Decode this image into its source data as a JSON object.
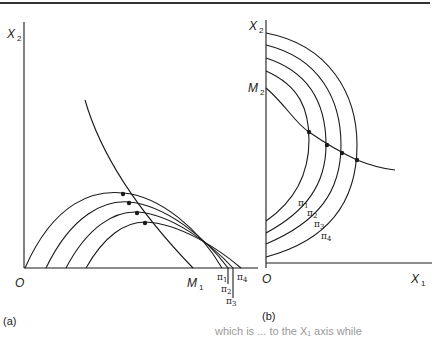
{
  "figure": {
    "panel_a": {
      "tag": "(a)",
      "y_axis_label": "X",
      "y_axis_sub": "2",
      "origin_label": "O",
      "m_label": "M",
      "m_sub": "1",
      "iso_labels": [
        {
          "sym": "π",
          "sub": "1"
        },
        {
          "sym": "π",
          "sub": "2"
        },
        {
          "sym": "π",
          "sub": "3"
        },
        {
          "sym": "π",
          "sub": "4"
        }
      ]
    },
    "panel_b": {
      "tag": "(b)",
      "y_axis_label": "X",
      "y_axis_sub": "2",
      "x_axis_label": "X",
      "x_axis_sub": "1",
      "origin_label": "O",
      "m_label": "M",
      "m_sub": "2",
      "iso_labels": [
        {
          "sym": "π",
          "sub": "1"
        },
        {
          "sym": "π",
          "sub": "2"
        },
        {
          "sym": "π",
          "sub": "3"
        },
        {
          "sym": "π",
          "sub": "4"
        }
      ]
    },
    "caption_fragment": "which is ... to the X₁ axis while"
  },
  "colors": {
    "ink": "#1a1a1a",
    "background": "#ffffff"
  }
}
